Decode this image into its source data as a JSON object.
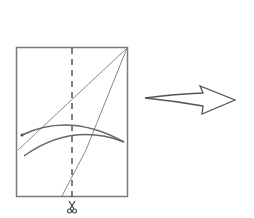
{
  "diagram": {
    "description": "Paper-folding step: rectangle sheet with dashed center cut line, two diagonal crease lines from top-right corner, two curved cut arcs, scissors at bottom of dashed line, and an outlined arrow pointing right to the next step.",
    "colors": {
      "stroke": "#6e6e6e",
      "frame": "#7a7a7a",
      "background": "#ffffff"
    },
    "sheet": {
      "x": 16,
      "y": 47,
      "width": 111,
      "height": 149
    },
    "cut_line": {
      "style": "dashed",
      "x": 72
    },
    "icons": [
      "scissors-icon",
      "arrow-right-icon"
    ]
  }
}
